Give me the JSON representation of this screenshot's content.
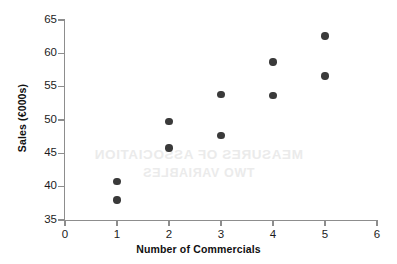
{
  "chart_data": {
    "type": "scatter",
    "title": "",
    "xlabel": "Number of Commercials",
    "ylabel": "Sales (€000s)",
    "xlim": [
      0,
      6
    ],
    "ylim": [
      35,
      65
    ],
    "xticks": [
      0,
      1,
      2,
      3,
      4,
      5,
      6
    ],
    "yticks": [
      35,
      40,
      45,
      50,
      55,
      60,
      65
    ],
    "xtick_labels": [
      "0",
      "1",
      "2",
      "3",
      "4",
      "5",
      "6"
    ],
    "ytick_labels": [
      "35",
      "40",
      "45",
      "50",
      "55",
      "60",
      "65"
    ],
    "grid": false,
    "legend": null,
    "marker_color": "#3a3a3a",
    "axis_color": "#8d8d8d",
    "background_color": "#ffffff",
    "series": [
      {
        "name": "Sales vs Commercials",
        "points": [
          {
            "x": 1,
            "y": 40.8
          },
          {
            "x": 1,
            "y": 38.0
          },
          {
            "x": 2,
            "y": 49.8
          },
          {
            "x": 2,
            "y": 45.8
          },
          {
            "x": 3,
            "y": 53.8
          },
          {
            "x": 3,
            "y": 47.7
          },
          {
            "x": 4,
            "y": 58.7
          },
          {
            "x": 4,
            "y": 53.7
          },
          {
            "x": 5,
            "y": 62.6
          },
          {
            "x": 5,
            "y": 56.6
          }
        ]
      }
    ]
  },
  "watermark": {
    "line1": "MEASURES OF ASSOCIATION",
    "line2": "TWO VARIABLES"
  }
}
